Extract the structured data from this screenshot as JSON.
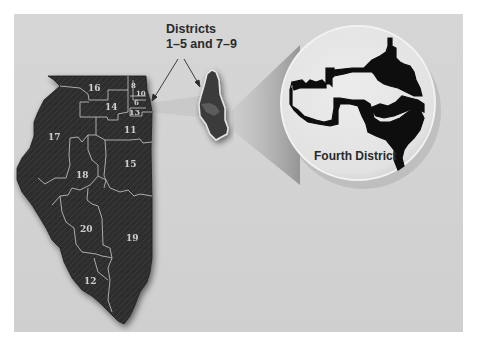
{
  "figure": {
    "callout_line1": "Districts",
    "callout_line2": "1–5 and 7–9",
    "inset_label": "Fourth District",
    "colors": {
      "panel": "#d4d4d4",
      "map_fill": "#2e2e2e",
      "district_border": "#bdbdbd",
      "district_label": "#cfcfcf",
      "inset_circle": "#e6e6e6"
    }
  },
  "map": {
    "state": "Illinois",
    "districts": [
      {
        "id": "8",
        "label": "8"
      },
      {
        "id": "10",
        "label": "10"
      },
      {
        "id": "6",
        "label": "6"
      },
      {
        "id": "13",
        "label": "13"
      },
      {
        "id": "16",
        "label": "16"
      },
      {
        "id": "14",
        "label": "14"
      },
      {
        "id": "11",
        "label": "11"
      },
      {
        "id": "17",
        "label": "17"
      },
      {
        "id": "18",
        "label": "18"
      },
      {
        "id": "15",
        "label": "15"
      },
      {
        "id": "20",
        "label": "20"
      },
      {
        "id": "19",
        "label": "19"
      },
      {
        "id": "12",
        "label": "12"
      }
    ]
  }
}
